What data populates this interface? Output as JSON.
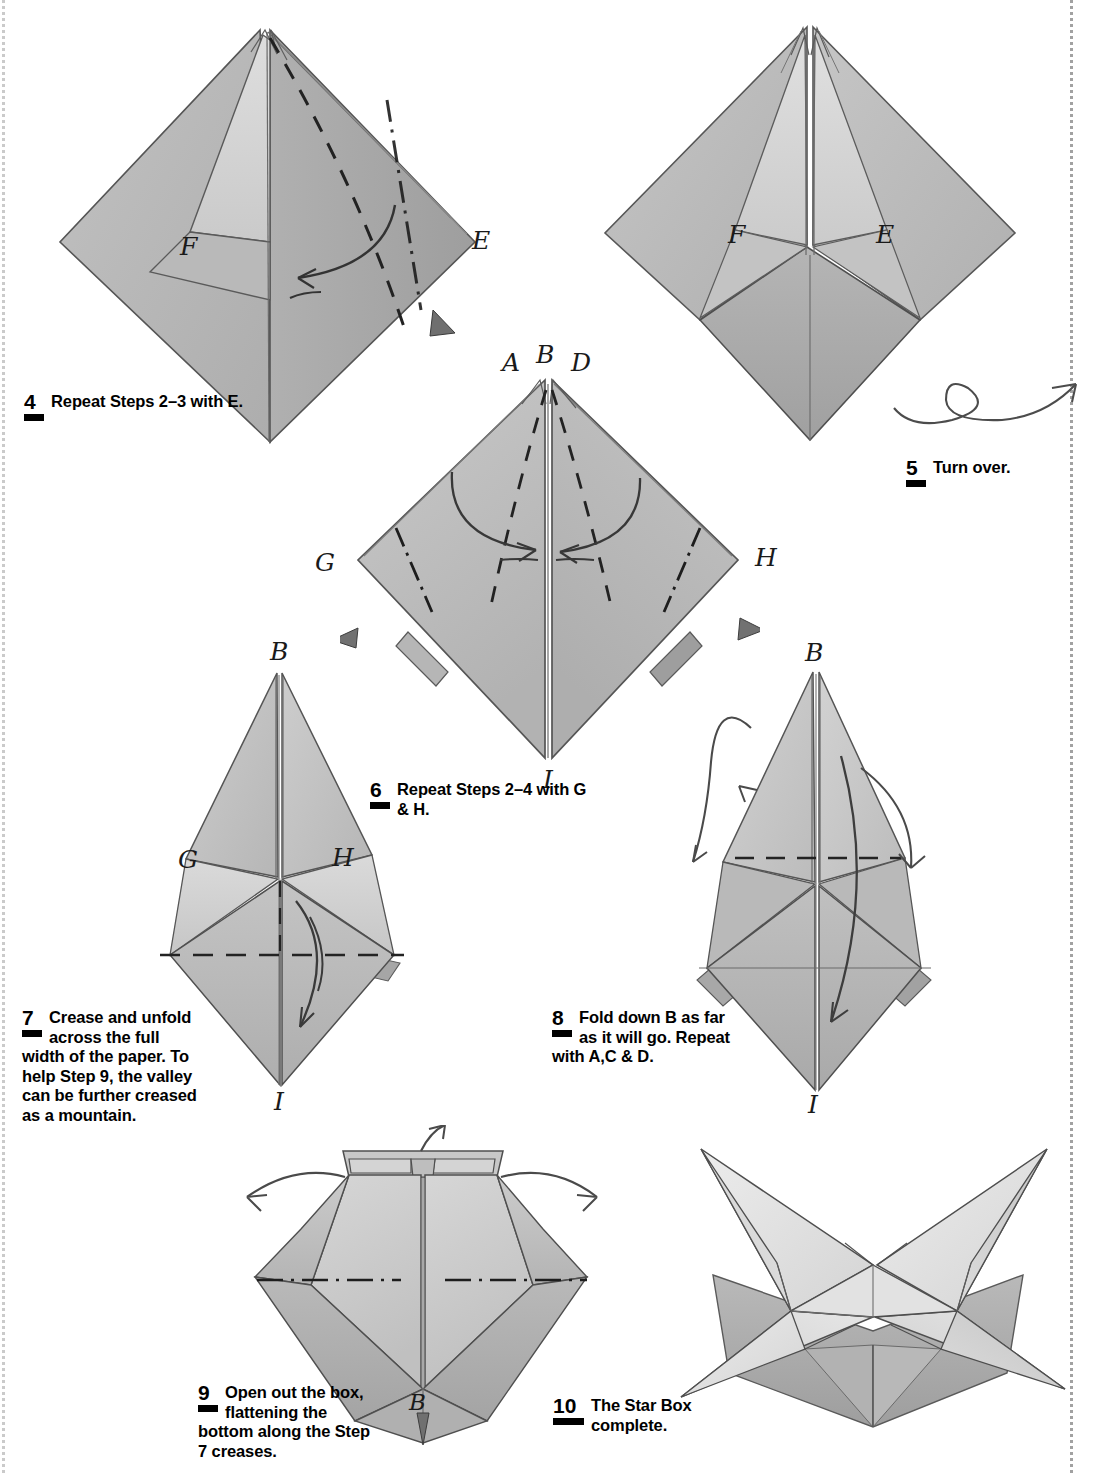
{
  "page": {
    "width": 1093,
    "height": 1475,
    "paper_color": "#ffffff",
    "ink_color": "#000000",
    "fold_grey_dark": "#b4b4b4",
    "fold_grey_mid": "#c8c8c8",
    "fold_grey_light": "#dcdcdc",
    "fold_grey_shadow": "#9a9a9a",
    "outline_color": "#4a4a4a"
  },
  "steps": [
    {
      "number": "4",
      "text": "Repeat Steps 2–3 with E."
    },
    {
      "number": "5",
      "text": "Turn over."
    },
    {
      "number": "6",
      "text": "Repeat Steps 2–4 with G & H."
    },
    {
      "number": "7",
      "text": "Crease and unfold across the full width of the paper. To help Step 9, the valley can be further creased as a mountain."
    },
    {
      "number": "8",
      "text": "Fold down B as far as it will go. Repeat with A,C & D."
    },
    {
      "number": "9",
      "text": "Open out the box, flattening the bottom along the Step 7 creases."
    },
    {
      "number": "10",
      "text": "The Star Box complete."
    }
  ],
  "figures": [
    {
      "id": "fig-step4",
      "name": "kite-with-E-and-F-flaps",
      "labels": [
        "F",
        "E"
      ],
      "fold_marks": [
        "valley-dashed",
        "mountain-dot-dash",
        "curved-fold-arrow",
        "solid-arrowhead"
      ]
    },
    {
      "id": "fig-step5",
      "name": "symmetric-kite-after-repeat",
      "labels": [
        "F",
        "E"
      ],
      "fold_marks": []
    },
    {
      "id": "fig-turnover-arrow",
      "name": "turn-over-loop-arrow",
      "labels": [],
      "fold_marks": [
        "loop-arrow"
      ]
    },
    {
      "id": "fig-step6",
      "name": "diamond-with-A-B-D-G-H-I",
      "labels": [
        "A",
        "B",
        "D",
        "G",
        "H",
        "I"
      ],
      "fold_marks": [
        "valley-dashed",
        "mountain-dot-dash",
        "curved-fold-arrow",
        "solid-arrowhead"
      ]
    },
    {
      "id": "fig-step7",
      "name": "tall-kite-crease-unfold",
      "labels": [
        "B",
        "G",
        "H",
        "I"
      ],
      "fold_marks": [
        "horizontal-dashed-crease",
        "curved-fold-arrow"
      ]
    },
    {
      "id": "fig-step8",
      "name": "tall-kite-fold-down-B",
      "labels": [
        "B",
        "I"
      ],
      "fold_marks": [
        "horizontal-dashed-crease",
        "curved-fold-arrow",
        "loop-arrow"
      ]
    },
    {
      "id": "fig-step9",
      "name": "box-opened-out",
      "labels": [
        "B",
        "I"
      ],
      "fold_marks": [
        "mountain-dot-dash",
        "spread-arrows",
        "solid-arrowhead"
      ]
    },
    {
      "id": "fig-step10",
      "name": "star-box-complete",
      "labels": [],
      "fold_marks": []
    }
  ],
  "point_labels": {
    "A": "A",
    "B": "B",
    "D": "D",
    "E": "E",
    "F": "F",
    "G": "G",
    "H": "H",
    "I": "I"
  }
}
